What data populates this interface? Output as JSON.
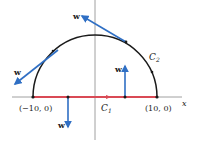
{
  "diagram": {
    "axes": {
      "x_label": "x"
    },
    "points": [
      {
        "label": "(−10, 0)"
      },
      {
        "label": "(10, 0)"
      }
    ],
    "curves": {
      "c1": {
        "name": "C",
        "sub": "1",
        "color": "#d94a55"
      },
      "c2": {
        "name": "C",
        "sub": "2",
        "color": "#1a1a1a"
      }
    },
    "vectors": [
      {
        "label": "w",
        "where": "top tangent"
      },
      {
        "label": "w",
        "where": "left tangent"
      },
      {
        "label": "w",
        "where": "up on C1"
      },
      {
        "label": "w",
        "where": "down on C1"
      }
    ],
    "colors": {
      "vector": "#2f6fc4",
      "axis": "#888888",
      "segment": "#d94a55",
      "arc": "#1a1a1a"
    }
  }
}
